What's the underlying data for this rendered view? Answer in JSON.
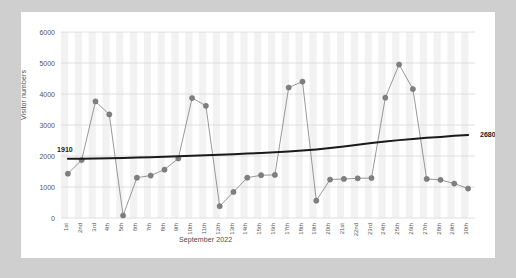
{
  "card": {
    "y_axis_title": "Visitor numbers",
    "x_axis_title": "September 2022"
  },
  "chart_data": {
    "type": "line",
    "title": "",
    "xlabel": "September 2022",
    "ylabel": "Visitor numbers",
    "ylim": [
      0,
      6000
    ],
    "ytick_values": [
      0,
      1000,
      2000,
      3000,
      4000,
      5000,
      6000
    ],
    "ytick_labels": [
      "0",
      "1000",
      "2000",
      "3000",
      "4000",
      "5000",
      "6000"
    ],
    "grid": "horizontal-and-vertical",
    "legend": "none",
    "categories": [
      "1st",
      "2nd",
      "3rd",
      "4th",
      "5th",
      "6th",
      "7th",
      "8th",
      "9th",
      "10th",
      "11th",
      "12th",
      "13th",
      "14th",
      "15th",
      "16th",
      "17th",
      "18th",
      "19th",
      "20th",
      "21st",
      "22nd",
      "23rd",
      "24th",
      "25th",
      "26th",
      "27th",
      "28th",
      "29th",
      "30th"
    ],
    "series": [
      {
        "name": "Visitor numbers",
        "type": "line-with-markers",
        "color": "#8c8c8c",
        "marker_color": "#7f7f7f",
        "values": [
          1430,
          1870,
          3760,
          3340,
          80,
          1300,
          1370,
          1560,
          1920,
          3870,
          3620,
          380,
          840,
          1300,
          1380,
          1390,
          4210,
          4400,
          560,
          1240,
          1260,
          1280,
          1290,
          3880,
          4950,
          4160,
          1260,
          1230,
          1110,
          950
        ]
      },
      {
        "name": "Trendline",
        "type": "trend-line",
        "color": "#1a1a1a",
        "start_label": "1910",
        "end_label": "2680",
        "start_value": 1910,
        "end_value": 2680,
        "values": [
          1910,
          1915,
          1920,
          1928,
          1938,
          1950,
          1962,
          1975,
          1990,
          2005,
          2022,
          2040,
          2058,
          2078,
          2098,
          2120,
          2145,
          2175,
          2212,
          2258,
          2310,
          2365,
          2418,
          2468,
          2512,
          2552,
          2586,
          2616,
          2650,
          2680
        ]
      }
    ]
  }
}
